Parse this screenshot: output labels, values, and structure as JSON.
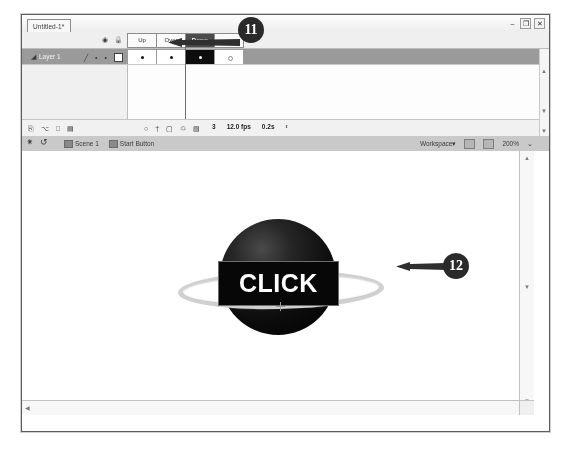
{
  "window": {
    "document_tab": "Untitled-1*",
    "controls": {
      "minimize": "–",
      "restore": "❐",
      "close": "✕"
    }
  },
  "timeline": {
    "layer_header_icons": [
      "eye-icon",
      "lock-icon",
      "outline-square-icon"
    ],
    "frame_labels": [
      {
        "label": "Up",
        "selected": false
      },
      {
        "label": "Over",
        "selected": false
      },
      {
        "label": "Down",
        "selected": true
      },
      {
        "label": "",
        "selected": false
      }
    ],
    "layers": [
      {
        "name": "Layer 1",
        "pencil": "pencil-icon",
        "visible_dot": "•",
        "lock_dot": "•",
        "outline_box": "outline-square-icon",
        "frames": [
          {
            "keyframe": "filled",
            "active": false
          },
          {
            "keyframe": "filled",
            "active": false
          },
          {
            "keyframe": "filled",
            "active": true
          },
          {
            "keyframe": "hollow",
            "active": false
          }
        ]
      }
    ],
    "status": {
      "left_tools": [
        "new-layer-icon",
        "new-folder-icon",
        "delete-layer-icon",
        "properties-icon"
      ],
      "playback_tools": [
        "onion-skin-icon",
        "frame-center-icon",
        "edit-multiple-icon",
        "loop-icon",
        "modify-markers-icon"
      ],
      "current_frame": "3",
      "frame_rate": "12.0 fps",
      "elapsed_time": "0.2s",
      "overflow": "‹"
    }
  },
  "edit_bar": {
    "back_icon": "back-to-scene-icon",
    "edit_scene_icon": "edit-scene-icon",
    "breadcrumbs": [
      {
        "label": "Scene 1"
      },
      {
        "label": "Start Button"
      }
    ],
    "workspace_label": "Workspace",
    "workspace_caret": "▾",
    "zoom_icons": [
      "zoom-out-icon",
      "zoom-in-icon"
    ],
    "zoom_level": "200%",
    "zoom_caret": "⌄"
  },
  "stage": {
    "artwork": {
      "button_label": "CLICK",
      "sphere": "dark-sphere-graphic",
      "ring": "elliptical-ring-graphic",
      "registration_mark": "registration-cross-icon"
    },
    "scrollbars": {
      "v_up": "▲",
      "v_down": "▼",
      "h_left": "◀",
      "h_right": "▶"
    }
  },
  "callouts": [
    {
      "id": "11",
      "number": "11",
      "target": "down-frame-label"
    },
    {
      "id": "12",
      "number": "12",
      "target": "button-artwork-ring"
    }
  ],
  "colors": {
    "selected_frame_bg": "#4c4c4c",
    "layer_row_bg": "#9a9a9a",
    "edit_bar_bg": "#c9c9c9",
    "callout_bg": "#2a2a2a",
    "artwork_dark": "#0c0c0c",
    "ring_light": "#d0d0d0"
  }
}
